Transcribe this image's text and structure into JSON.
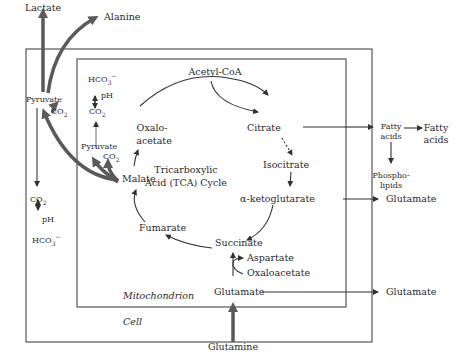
{
  "diagram": {
    "compartments": {
      "cell": "Cell",
      "mitochondrion": "Mitochondrion"
    },
    "cycle": {
      "center_line1": "Tricarboxylic",
      "center_line2": "Acid (TCA) Cycle",
      "nodes": [
        "Acetyl-CoA",
        "Citrate",
        "Isocitrate",
        "α-ketoglutarate",
        "Succinate",
        "Fumarate",
        "Malate",
        "Oxalo-",
        "acetate"
      ]
    },
    "labels": {
      "lactate": "Lactate",
      "alanine": "Alanine",
      "pyruvate_cell": "Pyruvate",
      "co2_cell_top": "CO",
      "co2_cell": "CO",
      "ph_cell": "pH",
      "hco3_cell": "HCO",
      "hco3_mito": "HCO",
      "ph_mito": "pH",
      "co2_mito": "CO",
      "pyruvate_mito": "Pyruvate",
      "co2_mito_small": "CO",
      "acetyl_coa": "Acetyl-CoA",
      "oxalo1": "Oxalo-",
      "oxalo2": "acetate",
      "citrate": "Citrate",
      "isocitrate": "Isocitrate",
      "akg": "α-ketoglutarate",
      "succinate": "Succinate",
      "fumarate": "Fumarate",
      "malate": "Malate",
      "aspartate": "Aspartate",
      "oxaloacetate": "Oxaloacetate",
      "glutamate_mito": "Glutamate",
      "glutamine": "Glutamine",
      "fatty_acids_cell1": "Fatty",
      "fatty_acids_cell2": "acids",
      "phospho1": "Phospho-",
      "phospho2": "lipids",
      "fatty_out1": "Fatty",
      "fatty_out2": "acids",
      "glutamate_out1": "Glutamate",
      "glutamate_out2": "Glutamate",
      "sub2": "2",
      "sub3": "3",
      "sup_minus": "−"
    },
    "colors": {
      "thick_arrow": "#5a5a5a",
      "line": "#333333",
      "box": "#555555"
    }
  }
}
